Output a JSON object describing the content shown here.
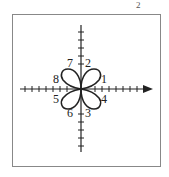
{
  "figure": {
    "corner_mark": "2",
    "labels": [
      {
        "text": "1",
        "x": 101,
        "y": 83
      },
      {
        "text": "2",
        "x": 85,
        "y": 67
      },
      {
        "text": "3",
        "x": 85,
        "y": 116
      },
      {
        "text": "4",
        "x": 101,
        "y": 102
      },
      {
        "text": "5",
        "x": 53,
        "y": 102
      },
      {
        "text": "6",
        "x": 66,
        "y": 116
      },
      {
        "text": "7",
        "x": 66,
        "y": 67
      },
      {
        "text": "8",
        "x": 53,
        "y": 83
      }
    ],
    "colors": {
      "stroke": "#222222",
      "frame": "#888888"
    }
  }
}
